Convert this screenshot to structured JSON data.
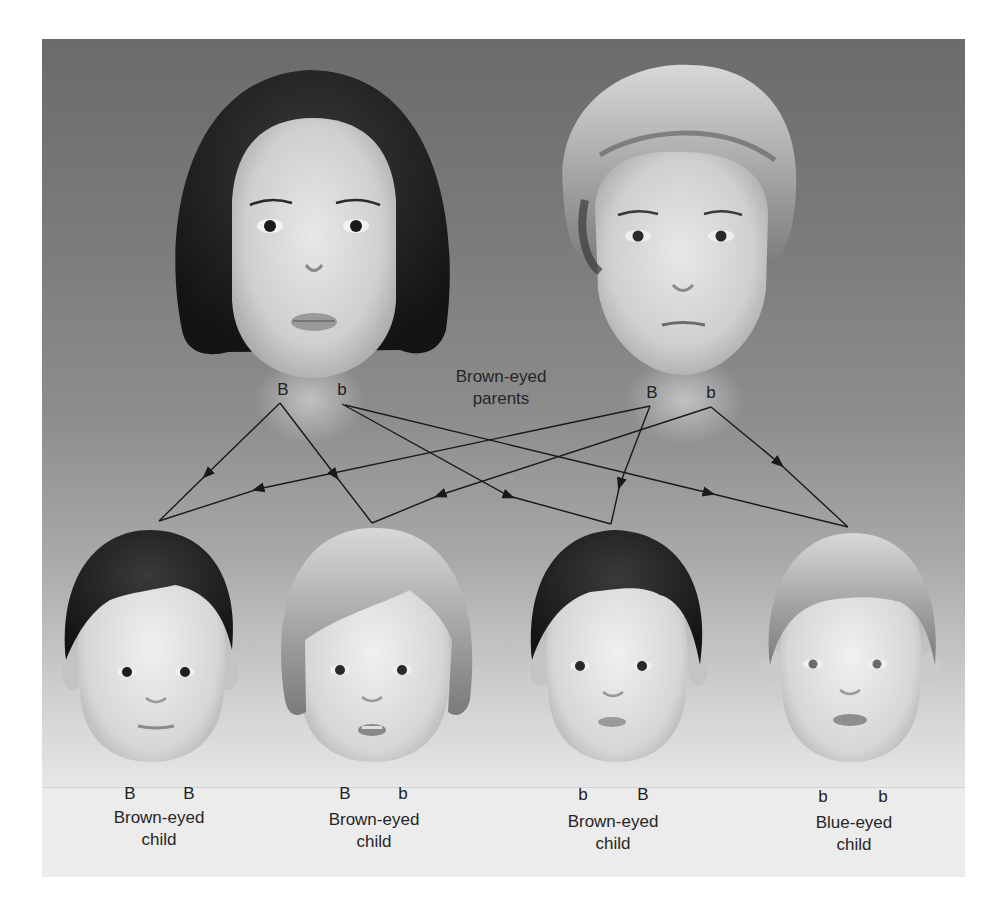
{
  "figure": {
    "colors": {
      "background_top": "#6b6b6b",
      "background_bottom": "#eeeeee",
      "line": "#1a1a1a",
      "text": "#262626"
    }
  },
  "parents": {
    "label_line1": "Brown-eyed",
    "label_line2": "parents",
    "mother": {
      "allele_1": "B",
      "allele_2": "b",
      "hair": "dark bob"
    },
    "father": {
      "allele_1": "B",
      "allele_2": "b",
      "hair": "blond short"
    }
  },
  "children": [
    {
      "allele_1": "B",
      "allele_2": "B",
      "label_line1": "Brown-eyed",
      "label_line2": "child",
      "hair": "dark"
    },
    {
      "allele_1": "B",
      "allele_2": "b",
      "label_line1": "Brown-eyed",
      "label_line2": "child",
      "hair": "blond bob"
    },
    {
      "allele_1": "b",
      "allele_2": "B",
      "label_line1": "Brown-eyed",
      "label_line2": "child",
      "hair": "dark"
    },
    {
      "allele_1": "b",
      "allele_2": "b",
      "label_line1": "Blue-eyed",
      "label_line2": "child",
      "hair": "blond"
    }
  ],
  "arrows": [
    {
      "from": "mother.B",
      "to": "child1"
    },
    {
      "from": "mother.B",
      "to": "child2"
    },
    {
      "from": "mother.b",
      "to": "child3"
    },
    {
      "from": "mother.b",
      "to": "child4"
    },
    {
      "from": "father.B",
      "to": "child1"
    },
    {
      "from": "father.B",
      "to": "child3"
    },
    {
      "from": "father.b",
      "to": "child2"
    },
    {
      "from": "father.b",
      "to": "child4"
    }
  ]
}
